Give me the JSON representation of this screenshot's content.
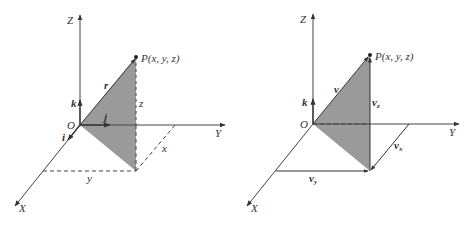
{
  "colors": {
    "background": "#ffffff",
    "axis": "#444444",
    "triangle_fill": "#9a9a9a",
    "text": "#333333"
  },
  "left_diagram": {
    "axes": {
      "x": "X",
      "y": "Y",
      "z": "Z"
    },
    "origin": "O",
    "point": "P(x, y, z)",
    "vector": "r",
    "unit_vectors": {
      "i": "i",
      "j": "j",
      "k": "k"
    },
    "components": {
      "x": "x",
      "y": "y",
      "z": "z"
    }
  },
  "right_diagram": {
    "axes": {
      "x": "X",
      "y": "Y",
      "z": "Z"
    },
    "origin": "O",
    "point": "P(x, y, z)",
    "vector": "v",
    "unit_vectors": {
      "k": "k"
    },
    "components": {
      "x": {
        "base": "v",
        "sub": "x"
      },
      "y": {
        "base": "v",
        "sub": "y"
      },
      "z": {
        "base": "v",
        "sub": "z"
      }
    }
  }
}
